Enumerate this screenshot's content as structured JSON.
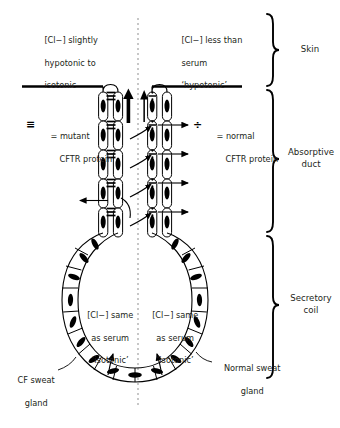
{
  "figure": {
    "type": "biological-schematic",
    "width": 340,
    "height": 428,
    "background": "#ffffff",
    "ink": "#000000",
    "midline_style": "dotted"
  },
  "annotations": {
    "left_top": {
      "line1": "[Cl−] slightly",
      "line2": "hypotonic to",
      "line3": "isotonic"
    },
    "right_top": {
      "line1": "[Cl−] less than",
      "line2": "serum",
      "line3": "‘hypotonic’"
    },
    "left_coil": {
      "line1": "[Cl−] same",
      "line2": "as serum",
      "line3": "‘isotonic’"
    },
    "right_coil": {
      "line1": "[Cl−] same",
      "line2": "as serum",
      "line3": "‘isotonic’"
    },
    "left_gland": {
      "line1": "CF sweat",
      "line2": "gland"
    },
    "right_gland": {
      "line1": "Normal sweat",
      "line2": "gland"
    }
  },
  "legend": {
    "mutant": {
      "symbol": "≡",
      "symbol_name": "triple-bar-mutant-cftr-symbol",
      "equals": "=",
      "line1": "= mutant",
      "line2": "CFTR protein"
    },
    "normal": {
      "symbol": "÷",
      "symbol_name": "divide-normal-cftr-symbol",
      "equals": "=",
      "line1": "= normal",
      "line2": "CFTR protein"
    }
  },
  "brackets": [
    {
      "id": "skin",
      "label": "Skin",
      "top": 14,
      "bottom": 86
    },
    {
      "id": "absorptive-duct",
      "label_line1": "Absorptive",
      "label_line2": "duct",
      "top": 90,
      "bottom": 232
    },
    {
      "id": "secretory-coil",
      "label_line1": "Secretory",
      "label_line2": "coil",
      "top": 236,
      "bottom": 378
    }
  ],
  "flow": {
    "left_duct_arrow": "thick-up-arrow",
    "right_duct_arrow": "thin-up-arrow",
    "left_transport": "chloride-blocked-outward",
    "right_transport": "chloride-reabsorbed-outward"
  }
}
